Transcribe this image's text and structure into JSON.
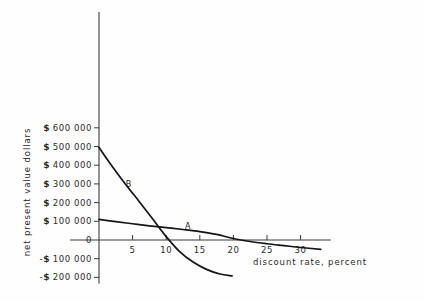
{
  "chart_data": {
    "type": "line",
    "title": "",
    "xlabel": "discount rate, percent",
    "ylabel": "net present value dollars",
    "xlim": [
      -1.5,
      35
    ],
    "ylim": [
      -220000,
      650000
    ],
    "grid": false,
    "legend_position": "inline-annotations",
    "x_ticks": [
      5,
      10,
      15,
      20,
      25,
      30
    ],
    "x_tick_labels": [
      "5",
      "10",
      "15",
      "20",
      "25",
      "30"
    ],
    "y_ticks": [
      600000,
      500000,
      400000,
      300000,
      200000,
      100000,
      0,
      -100000,
      -200000
    ],
    "y_tick_labels": [
      "$ 600 000",
      "$ 500 000",
      "$ 400 000",
      "$ 300 000",
      "$ 200 000",
      "$ 100 000",
      "0",
      "-$ 100 000",
      "-$ 200 000"
    ],
    "series": [
      {
        "name": "A",
        "label": "A",
        "label_x": 13.2,
        "label_y": 58000,
        "x": [
          0,
          2.5,
          5,
          7.5,
          10,
          12.5,
          15,
          17.5,
          20,
          22.5,
          25,
          27.5,
          30,
          33
        ],
        "y": [
          110000,
          98000,
          87000,
          76000,
          66000,
          56000,
          45000,
          30000,
          8000,
          -8000,
          -20000,
          -30000,
          -40000,
          -50000
        ]
      },
      {
        "name": "B",
        "label": "B",
        "label_x": 4.4,
        "label_y": 282000,
        "x": [
          0,
          2,
          4,
          6,
          8,
          10,
          12,
          14,
          16,
          18,
          19.8
        ],
        "y": [
          495000,
          392000,
          296000,
          205000,
          112000,
          18000,
          -62000,
          -118000,
          -157000,
          -182000,
          -192000
        ]
      }
    ]
  },
  "axis_titles": {
    "x": "discount rate, percent",
    "y": "net present value dollars"
  }
}
